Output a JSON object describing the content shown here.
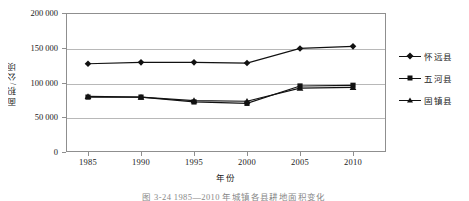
{
  "chart_data": {
    "type": "line",
    "title": "",
    "xlabel": "年份",
    "ylabel": "面积/公顷",
    "x": [
      1985,
      1990,
      1995,
      2000,
      2005,
      2010
    ],
    "xtick_labels": [
      "1985",
      "1990",
      "1995",
      "2000",
      "2005",
      "2010"
    ],
    "ytick_labels": [
      "0",
      "50 000",
      "100 000",
      "150 000",
      "200 000"
    ],
    "ytick_values": [
      0,
      50000,
      100000,
      150000,
      200000
    ],
    "ylim": [
      0,
      200000
    ],
    "xlim": [
      1983,
      2012
    ],
    "grid": "horizontal",
    "legend_position": "right",
    "series": [
      {
        "name": "怀远县",
        "marker": "diamond",
        "color": "#111111",
        "values": [
          127000,
          129000,
          129000,
          128000,
          149000,
          152000
        ]
      },
      {
        "name": "五河县",
        "marker": "square",
        "color": "#111111",
        "values": [
          79000,
          79000,
          72000,
          70000,
          95000,
          96000
        ]
      },
      {
        "name": "固镇县",
        "marker": "triangle",
        "color": "#111111",
        "values": [
          80000,
          79000,
          74000,
          73000,
          92000,
          93000
        ]
      }
    ]
  },
  "axes": {
    "y_title": "面积/公顷",
    "x_title": "年份"
  },
  "legend": {
    "items": [
      {
        "label": "怀远县",
        "marker": "diamond"
      },
      {
        "label": "五河县",
        "marker": "square"
      },
      {
        "label": "固镇县",
        "marker": "triangle"
      }
    ]
  },
  "caption": {
    "text": "图 3-24  1985—2010 年城镇各县耕地面积变化"
  },
  "colors": {
    "line": "#111111",
    "frame": "#8f8f8f",
    "grid": "#b8b8b8",
    "background": "#ffffff",
    "text": "#1a1a1a"
  }
}
